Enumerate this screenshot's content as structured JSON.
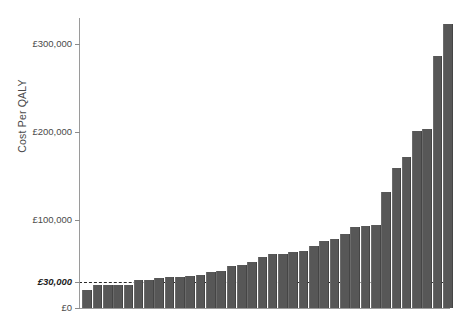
{
  "chart_data": {
    "type": "bar",
    "title": "",
    "subtitle": "",
    "xlabel": "",
    "ylabel": "Cost Per QALY",
    "ylim": [
      0,
      330000
    ],
    "grid": false,
    "legend": null,
    "currency": "GBP",
    "bar_color": "#575757",
    "threshold": {
      "value": 30000,
      "label": "£30,000",
      "style": "dashed",
      "color": "#2b2b2b"
    },
    "yticks": [
      0,
      30000,
      100000,
      200000,
      300000
    ],
    "ytick_labels": [
      "£0",
      "£30,000",
      "£100,000",
      "£200,000",
      "£300,000"
    ],
    "categories": [
      "1",
      "2",
      "3",
      "4",
      "5",
      "6",
      "7",
      "8",
      "9",
      "10",
      "11",
      "12",
      "13",
      "14",
      "15",
      "16",
      "17",
      "18",
      "19",
      "20",
      "21",
      "22",
      "23",
      "24",
      "25",
      "26",
      "27",
      "28",
      "29",
      "30",
      "31",
      "32",
      "33",
      "34"
    ],
    "values": [
      20000,
      26000,
      26000,
      26000,
      26000,
      32000,
      32000,
      34000,
      35000,
      35000,
      36000,
      38000,
      41000,
      42000,
      48000,
      49000,
      52000,
      58000,
      61000,
      61000,
      64000,
      65000,
      71000,
      76000,
      79000,
      84000,
      92000,
      93000,
      94000,
      132000,
      159000,
      172000,
      201000,
      204000
    ],
    "values_tail": [
      287000,
      323000
    ],
    "n_bars": 36,
    "annotations": []
  },
  "axis": {
    "ylabel_text": "Cost Per QALY"
  },
  "xcaptions": [
    "",
    "",
    "",
    "",
    "",
    "",
    "",
    "",
    "",
    "",
    "",
    ""
  ]
}
